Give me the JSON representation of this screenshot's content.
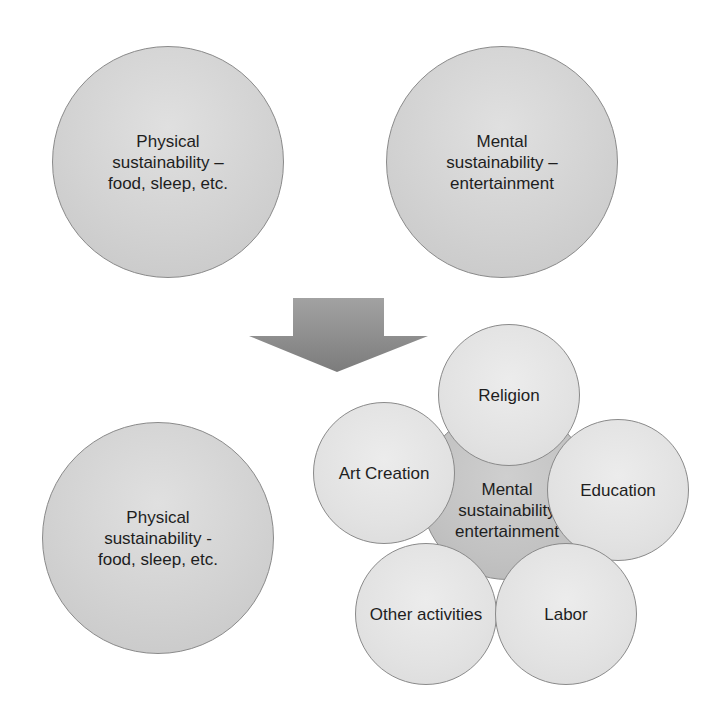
{
  "diagram": {
    "top": {
      "physical": {
        "label": "Physical\nsustainability –\nfood, sleep, etc."
      },
      "mental": {
        "label": "Mental\nsustainability –\nentertainment"
      }
    },
    "arrow": {
      "direction": "down",
      "color": "#8c8c8c"
    },
    "bottom": {
      "physical": {
        "label": "Physical\nsustainability -\nfood, sleep, etc."
      },
      "mental_core": {
        "label": "Mental\nsustainability\nentertainment"
      },
      "satellites": [
        {
          "id": "religion",
          "label": "Religion"
        },
        {
          "id": "art-creation",
          "label": "Art Creation"
        },
        {
          "id": "education",
          "label": "Education"
        },
        {
          "id": "other-activities",
          "label": "Other activities"
        },
        {
          "id": "labor",
          "label": "Labor"
        }
      ]
    }
  }
}
